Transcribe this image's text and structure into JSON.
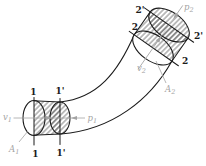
{
  "figure": {
    "type": "stream-tube-flow-diagram",
    "colors": {
      "background": "#ffffff",
      "ink": "#1b1b1b",
      "annotation": "#a3a3a3",
      "hatch": "#3a3a3a"
    },
    "inlet": {
      "section_1": {
        "top": "1",
        "bottom": "1"
      },
      "section_1p": {
        "top": "1'",
        "bottom": "1'"
      },
      "velocity": {
        "base": "v",
        "sub": "1"
      },
      "pressure": {
        "base": "p",
        "sub": "1"
      },
      "area": {
        "base": "A",
        "sub": "1"
      }
    },
    "outlet": {
      "section_2": {
        "upper": "2",
        "lower": "2"
      },
      "section_2p": {
        "top": "2'",
        "right": "2'"
      },
      "velocity": {
        "base": "v",
        "sub": "2"
      },
      "pressure": {
        "base": "p",
        "sub": "2"
      },
      "area": {
        "base": "A",
        "sub": "2"
      }
    }
  }
}
